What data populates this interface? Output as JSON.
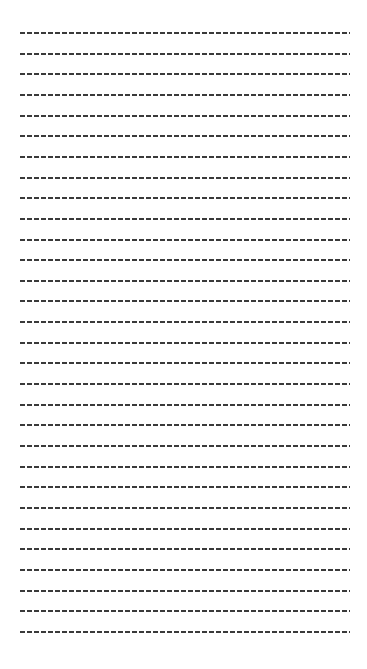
{
  "page": {
    "type": "ruled-dashed-sheet",
    "line_count": 30,
    "first_line_y": 33,
    "line_spacing": 20.65,
    "line_left": 20,
    "line_width": 330,
    "dash_color": "#3a3a3a",
    "background": "#ffffff"
  }
}
